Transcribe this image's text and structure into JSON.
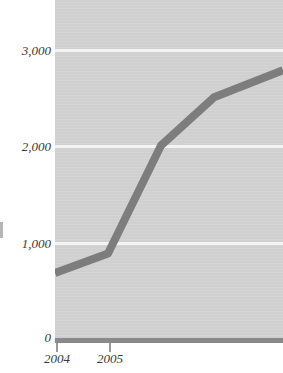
{
  "chart_data": {
    "type": "line",
    "title": "",
    "subtitle": "",
    "xlabel": "",
    "ylabel": "",
    "grid": true,
    "legend": false,
    "xlim": [
      2004,
      2008.3
    ],
    "ylim": [
      0,
      3500
    ],
    "y_ticks": [
      0,
      1000,
      2000,
      3000
    ],
    "y_tick_labels": [
      "0",
      "1,000",
      "2,000",
      "3,000"
    ],
    "x_ticks": [
      2004,
      2005
    ],
    "x_tick_labels": [
      "2004",
      "2005"
    ],
    "series": [
      {
        "name": "series-1",
        "color": "#7d7d7d",
        "x": [
          2004,
          2005,
          2006,
          2007,
          2008.3
        ],
        "values": [
          680,
          880,
          2000,
          2500,
          2780
        ]
      }
    ],
    "note": "line continues past the right crop edge"
  },
  "axes": {
    "y_labels": [
      {
        "text": "3,000",
        "value": 3000
      },
      {
        "text": "2,000",
        "value": 2000
      },
      {
        "text": "1,000",
        "value": 1000
      },
      {
        "text": "0",
        "value": 0
      }
    ],
    "x_labels": [
      {
        "text": "2004",
        "value": 2004
      },
      {
        "text": "2005",
        "value": 2005
      }
    ]
  },
  "colors": {
    "plot_background": "#d2d2d2",
    "gridline": "#f4f4f4",
    "series_line": "#7d7d7d",
    "axis_line": "#8a8a8a",
    "tick_mark": "#9a9a9a",
    "label_text": "#3a3a3a",
    "page_background": "#ffffff"
  }
}
